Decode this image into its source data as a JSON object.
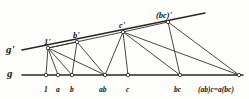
{
  "figure": {
    "ink_color": "#1a1714",
    "line_color": "#2b2622",
    "background": "#fdfdfb",
    "axes": [
      {
        "name": "g-prime",
        "label": "g'",
        "label_x": 6,
        "label_y": 44
      },
      {
        "name": "g",
        "label": "g",
        "label_x": 7,
        "label_y": 68
      }
    ],
    "baseline": {
      "name": "line-g",
      "y": 75,
      "x_start": 22,
      "x_end": 243
    },
    "upperline": {
      "name": "line-g-prime",
      "x_start": 22,
      "y_start": 50,
      "x_end": 205,
      "y_end": 13
    },
    "lower_points": [
      {
        "id": "p1",
        "label": "1",
        "x": 46,
        "y": 75,
        "label_x": 44,
        "label_y": 86
      },
      {
        "id": "pa",
        "label": "a",
        "x": 58,
        "y": 75,
        "label_x": 56,
        "label_y": 86
      },
      {
        "id": "pb",
        "label": "b",
        "x": 72,
        "y": 75,
        "label_x": 70,
        "label_y": 86
      },
      {
        "id": "pab",
        "label": "ab",
        "x": 105,
        "y": 75,
        "label_x": 99,
        "label_y": 86
      },
      {
        "id": "pc",
        "label": "c",
        "x": 128,
        "y": 75,
        "label_x": 126,
        "label_y": 86
      },
      {
        "id": "pbc",
        "label": "bc",
        "x": 180,
        "y": 75,
        "label_x": 174,
        "label_y": 86
      },
      {
        "id": "pabc",
        "label": "(ab)c=a(bc)",
        "x": 239,
        "y": 75,
        "label_x": 198,
        "label_y": 86
      }
    ],
    "upper_points": [
      {
        "id": "q1",
        "label": "1'",
        "x": 48,
        "y": 48,
        "label_x": 44,
        "label_y": 38
      },
      {
        "id": "qb",
        "label": "b'",
        "x": 77,
        "y": 42,
        "label_x": 73,
        "label_y": 31
      },
      {
        "id": "qc",
        "label": "c'",
        "x": 123,
        "y": 32,
        "label_x": 119,
        "label_y": 21
      },
      {
        "id": "qbc",
        "label": "(bc)'",
        "x": 168,
        "y": 22,
        "label_x": 156,
        "label_y": 11
      }
    ],
    "segments": [
      {
        "name": "seg-1prime-1",
        "x1": 48,
        "y1": 48,
        "x2": 46,
        "y2": 75
      },
      {
        "name": "seg-1prime-a",
        "x1": 48,
        "y1": 48,
        "x2": 58,
        "y2": 75
      },
      {
        "name": "seg-1prime-b",
        "x1": 48,
        "y1": 48,
        "x2": 72,
        "y2": 75
      },
      {
        "name": "seg-1prime-ab",
        "x1": 48,
        "y1": 48,
        "x2": 105,
        "y2": 75
      },
      {
        "name": "seg-1prime-bprime",
        "x1": 48,
        "y1": 48,
        "x2": 77,
        "y2": 42
      },
      {
        "name": "seg-1prime-cprime",
        "x1": 48,
        "y1": 48,
        "x2": 123,
        "y2": 32
      },
      {
        "name": "seg-bprime-b",
        "x1": 77,
        "y1": 42,
        "x2": 72,
        "y2": 75
      },
      {
        "name": "seg-bprime-ab",
        "x1": 77,
        "y1": 42,
        "x2": 105,
        "y2": 75
      },
      {
        "name": "seg-cprime-c",
        "x1": 123,
        "y1": 32,
        "x2": 128,
        "y2": 75
      },
      {
        "name": "seg-cprime-ab",
        "x1": 123,
        "y1": 32,
        "x2": 105,
        "y2": 75
      },
      {
        "name": "seg-cprime-bc",
        "x1": 123,
        "y1": 32,
        "x2": 180,
        "y2": 75
      },
      {
        "name": "seg-cprime-abc",
        "x1": 123,
        "y1": 32,
        "x2": 239,
        "y2": 75
      },
      {
        "name": "seg-cprime-bcprime",
        "x1": 123,
        "y1": 32,
        "x2": 168,
        "y2": 22
      },
      {
        "name": "seg-bcprime-bc",
        "x1": 168,
        "y1": 22,
        "x2": 180,
        "y2": 75
      },
      {
        "name": "seg-bcprime-abc",
        "x1": 168,
        "y1": 22,
        "x2": 239,
        "y2": 75
      }
    ]
  }
}
